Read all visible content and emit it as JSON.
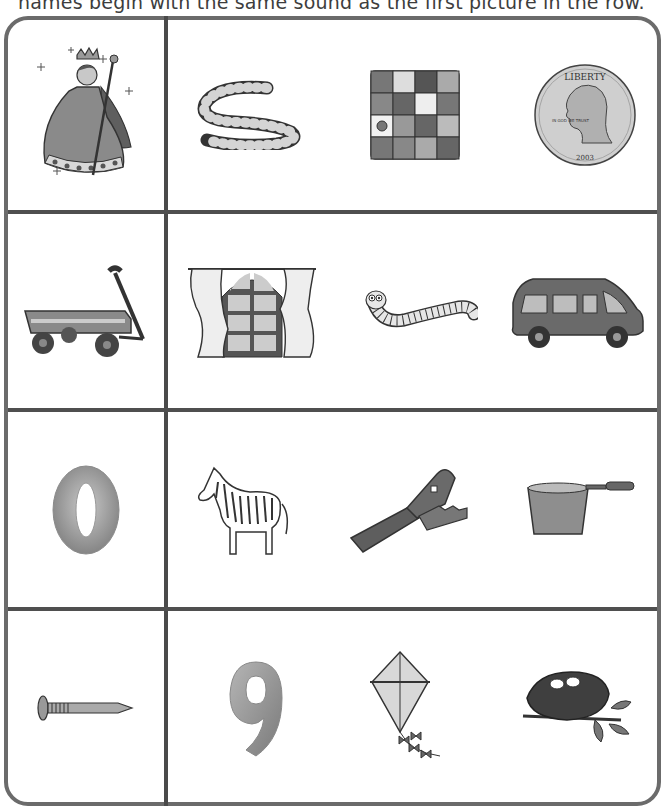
{
  "instructions": "names begin with the same sound as the first picture in the row.",
  "rows": [
    {
      "target": {
        "name": "queen",
        "letter": "q"
      },
      "choices": [
        {
          "name": "rope"
        },
        {
          "name": "quilt"
        },
        {
          "name": "quarter",
          "coin_text": {
            "top": "LIBERTY",
            "motto": "IN GOD WE TRUST",
            "year": "2003"
          }
        }
      ]
    },
    {
      "target": {
        "name": "wagon",
        "letter": "w"
      },
      "choices": [
        {
          "name": "window"
        },
        {
          "name": "worm"
        },
        {
          "name": "van"
        }
      ]
    },
    {
      "target": {
        "name": "zero",
        "letter": "z",
        "glyph": "0"
      },
      "choices": [
        {
          "name": "zebra"
        },
        {
          "name": "zipper"
        },
        {
          "name": "pan"
        }
      ]
    },
    {
      "target": {
        "name": "nail",
        "letter": "n"
      },
      "choices": [
        {
          "name": "nine",
          "glyph": "9"
        },
        {
          "name": "kite"
        },
        {
          "name": "nest"
        }
      ]
    }
  ],
  "colors": {
    "border": "#6b6b6b",
    "divider": "#4a4a4a",
    "ink": "#333333",
    "fill_gray": "#8a8a8a",
    "fill_light": "#cfcfcf"
  }
}
